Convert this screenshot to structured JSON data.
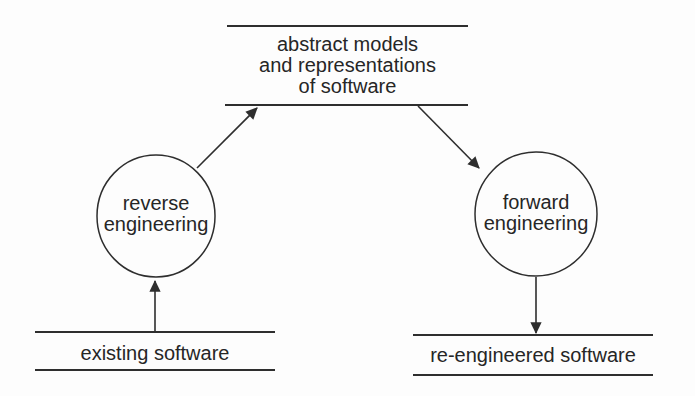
{
  "diagram": {
    "type": "flow-diagram",
    "colors": {
      "ink": "#2e2e2e",
      "background": "#fdfdfd"
    },
    "nodes": {
      "abstract_models": {
        "shape": "parallel-lines",
        "lines": [
          "abstract models",
          "and representations",
          "of software"
        ]
      },
      "reverse_engineering": {
        "shape": "circle",
        "lines": [
          "reverse",
          "engineering"
        ]
      },
      "forward_engineering": {
        "shape": "circle",
        "lines": [
          "forward",
          "engineering"
        ]
      },
      "existing_software": {
        "shape": "parallel-lines",
        "lines": [
          "existing software"
        ]
      },
      "re_engineered_software": {
        "shape": "parallel-lines",
        "lines": [
          "re-engineered software"
        ]
      }
    },
    "edges": [
      {
        "from": "existing_software",
        "to": "reverse_engineering",
        "direction": "up"
      },
      {
        "from": "reverse_engineering",
        "to": "abstract_models",
        "direction": "up-right"
      },
      {
        "from": "abstract_models",
        "to": "forward_engineering",
        "direction": "down-right"
      },
      {
        "from": "forward_engineering",
        "to": "re_engineered_software",
        "direction": "down"
      }
    ]
  }
}
